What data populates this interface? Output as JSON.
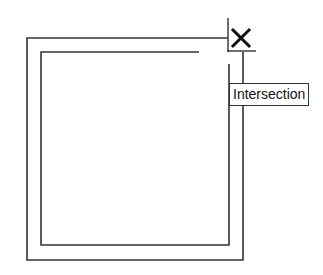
{
  "drawing": {
    "type": "cad-object-snap",
    "line_color": "#333333",
    "outer_path": [
      [
        200,
        38
      ],
      [
        27,
        38
      ],
      [
        27,
        260
      ],
      [
        243,
        260
      ],
      [
        243,
        52
      ]
    ],
    "outer_top_extent": [
      [
        27,
        38
      ],
      [
        228,
        38
      ]
    ],
    "inner_path": [
      [
        199,
        52
      ],
      [
        41,
        52
      ],
      [
        41,
        245
      ],
      [
        229,
        245
      ],
      [
        229,
        64
      ]
    ],
    "crosshair": {
      "x": 228,
      "y": 51,
      "vertical_from": 18,
      "horizontal_to": 256
    },
    "snap_marker": {
      "icon": "x-mark-icon",
      "x": 241,
      "y": 38,
      "size": 16
    }
  },
  "tooltip": {
    "label": "Intersection"
  }
}
